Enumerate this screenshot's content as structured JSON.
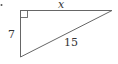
{
  "figure": {
    "type": "right-triangle",
    "marker": "•",
    "labels": {
      "top_side": "x",
      "left_side": "7",
      "hypotenuse": "15"
    },
    "right_angle_marker": "square-at-top-left",
    "colors": {
      "stroke": "#555555",
      "text": "#333333",
      "background": "#ffffff"
    }
  }
}
